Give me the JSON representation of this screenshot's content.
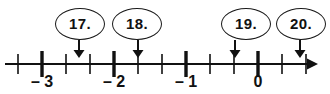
{
  "figure": {
    "type": "number-line-exercise",
    "background_color": "#ffffff",
    "ink_color": "#111111"
  },
  "number_line": {
    "axis_start_x": 5,
    "axis_end_x": 318,
    "axis_y": 64,
    "has_right_arrowhead": true,
    "unit_spacing_px": 72,
    "subdivisions_per_unit": 3,
    "major_ticks": [
      {
        "label": "– 3",
        "value": -3,
        "x": 42
      },
      {
        "label": "– 2",
        "value": -2,
        "x": 114
      },
      {
        "label": "– 1",
        "value": -1,
        "x": 186
      },
      {
        "label": "0",
        "value": 0,
        "x": 258
      }
    ],
    "minor_tick_x": [
      18,
      66,
      90,
      138,
      162,
      210,
      234,
      282,
      306
    ],
    "label_y": 74
  },
  "callouts": [
    {
      "label": "17.",
      "ellipse_cx": 80,
      "ellipse_cy": 24,
      "rx": 25,
      "ry": 16,
      "pointer_x": 79,
      "pointer_top": 40,
      "pointer_bottom": 58
    },
    {
      "label": "18.",
      "ellipse_cx": 137,
      "ellipse_cy": 24,
      "rx": 25,
      "ry": 16,
      "pointer_x": 138,
      "pointer_top": 40,
      "pointer_bottom": 58
    },
    {
      "label": "19.",
      "ellipse_cx": 246,
      "ellipse_cy": 24,
      "rx": 25,
      "ry": 16,
      "pointer_x": 235,
      "pointer_top": 40,
      "pointer_bottom": 58
    },
    {
      "label": "20.",
      "ellipse_cx": 301,
      "ellipse_cy": 24,
      "rx": 25,
      "ry": 16,
      "pointer_x": 300,
      "pointer_top": 40,
      "pointer_bottom": 58
    }
  ],
  "chart_data": {
    "type": "line",
    "title": "",
    "xlabel": "",
    "ylabel": "",
    "xlim": [
      -3.55,
      0.85
    ],
    "categories": [
      "– 3",
      "– 2",
      "– 1",
      "0"
    ],
    "values": [
      -3,
      -2,
      -1,
      0
    ],
    "tick_labels": [
      "– 3",
      "– 2",
      "– 1",
      "0"
    ],
    "minor_ticks_per_interval": 2,
    "grid": false,
    "legend": "none",
    "annotations": [
      {
        "text": "17.",
        "points_to_value": -2.5
      },
      {
        "text": "18.",
        "points_to_value": -1.666
      },
      {
        "text": "19.",
        "points_to_value": -0.32
      },
      {
        "text": "20.",
        "points_to_value": 0.583
      }
    ]
  }
}
